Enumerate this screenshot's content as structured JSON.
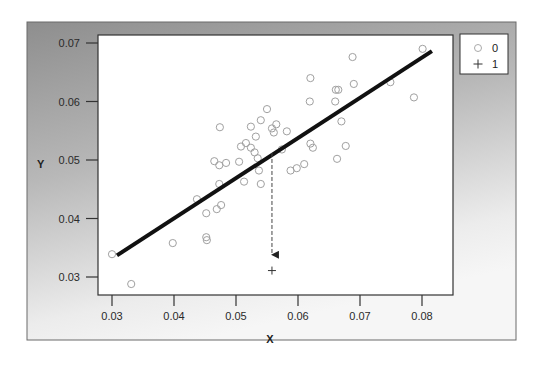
{
  "chart_data": {
    "type": "scatter",
    "title": "",
    "xlabel": "X",
    "ylabel": "Y",
    "xlim": [
      0.0275,
      0.085
    ],
    "ylim": [
      0.0268,
      0.0715
    ],
    "x_ticks": [
      0.03,
      0.04,
      0.05,
      0.06,
      0.07,
      0.08
    ],
    "x_tick_labels": [
      "0.03",
      "0.04",
      "0.05",
      "0.06",
      "0.07",
      "0.08"
    ],
    "y_ticks": [
      0.03,
      0.04,
      0.05,
      0.06,
      0.07
    ],
    "y_tick_labels": [
      "0.03",
      "0.04",
      "0.05",
      "0.06",
      "0.07"
    ],
    "grid": false,
    "legend_position": "right-top",
    "legend": [
      {
        "marker": "circle",
        "label": "0"
      },
      {
        "marker": "plus",
        "label": "1"
      }
    ],
    "series": [
      {
        "name": "0",
        "marker": "circle",
        "color": "#9a9a9a",
        "points": [
          [
            0.03,
            0.0339
          ],
          [
            0.0331,
            0.0288
          ],
          [
            0.0398,
            0.0358
          ],
          [
            0.0452,
            0.0368
          ],
          [
            0.0453,
            0.0363
          ],
          [
            0.0452,
            0.0409
          ],
          [
            0.0469,
            0.0416
          ],
          [
            0.0476,
            0.0423
          ],
          [
            0.0473,
            0.0459
          ],
          [
            0.0437,
            0.0433
          ],
          [
            0.0465,
            0.0498
          ],
          [
            0.0473,
            0.0491
          ],
          [
            0.0484,
            0.0495
          ],
          [
            0.0505,
            0.0497
          ],
          [
            0.0474,
            0.0556
          ],
          [
            0.0508,
            0.0523
          ],
          [
            0.0516,
            0.0529
          ],
          [
            0.0524,
            0.0521
          ],
          [
            0.053,
            0.0513
          ],
          [
            0.0535,
            0.0503
          ],
          [
            0.0513,
            0.0463
          ],
          [
            0.054,
            0.0459
          ],
          [
            0.0537,
            0.0482
          ],
          [
            0.0532,
            0.054
          ],
          [
            0.0524,
            0.0557
          ],
          [
            0.054,
            0.0568
          ],
          [
            0.055,
            0.0587
          ],
          [
            0.0558,
            0.0554
          ],
          [
            0.0561,
            0.0547
          ],
          [
            0.0565,
            0.0561
          ],
          [
            0.0574,
            0.0518
          ],
          [
            0.0582,
            0.0549
          ],
          [
            0.0588,
            0.0482
          ],
          [
            0.0598,
            0.0486
          ],
          [
            0.061,
            0.0493
          ],
          [
            0.062,
            0.0528
          ],
          [
            0.0619,
            0.06
          ],
          [
            0.062,
            0.064
          ],
          [
            0.0624,
            0.0521
          ],
          [
            0.0661,
            0.062
          ],
          [
            0.0665,
            0.062
          ],
          [
            0.0663,
            0.0502
          ],
          [
            0.067,
            0.0566
          ],
          [
            0.0677,
            0.0524
          ],
          [
            0.069,
            0.063
          ],
          [
            0.0688,
            0.0676
          ],
          [
            0.0749,
            0.0633
          ],
          [
            0.0787,
            0.0607
          ],
          [
            0.0801,
            0.069
          ],
          [
            0.066,
            0.06
          ]
        ]
      },
      {
        "name": "1",
        "marker": "plus",
        "color": "#333333",
        "points": [
          [
            0.0558,
            0.0311
          ]
        ]
      }
    ],
    "fit_line": {
      "color": "#111111",
      "from": [
        0.0308,
        0.0337
      ],
      "to": [
        0.0816,
        0.0686
      ]
    },
    "annotations": [
      {
        "type": "dashed-arrow",
        "from": [
          0.0558,
          0.0512
        ],
        "to": [
          0.0558,
          0.0326
        ],
        "description": "projection from regression line down to class-1 point"
      }
    ]
  }
}
